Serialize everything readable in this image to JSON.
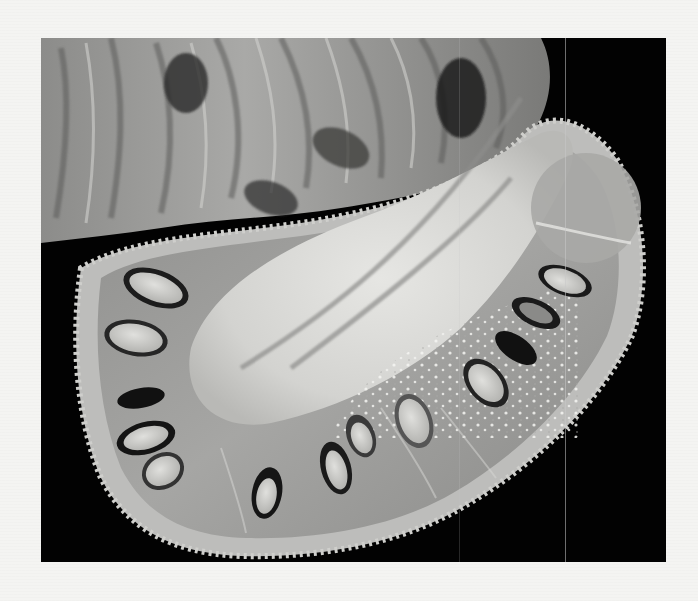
{
  "image": {
    "subject": "Halved jackfruit cross-section",
    "alt_text": "Black-and-white photograph of a jackfruit cut in half, showing the pale fibrous core, seed pods arranged radially, and spiky rind, on a black background",
    "style": "grayscale photograph",
    "colors": {
      "page_background": "#f4f4f2",
      "photo_background": "#020202",
      "core": "#d9d9d6",
      "flesh": "#9a9a98",
      "seed": "#cfcfcc",
      "seed_outline": "#1a1a1a",
      "rind": "#bdbdbb"
    }
  }
}
